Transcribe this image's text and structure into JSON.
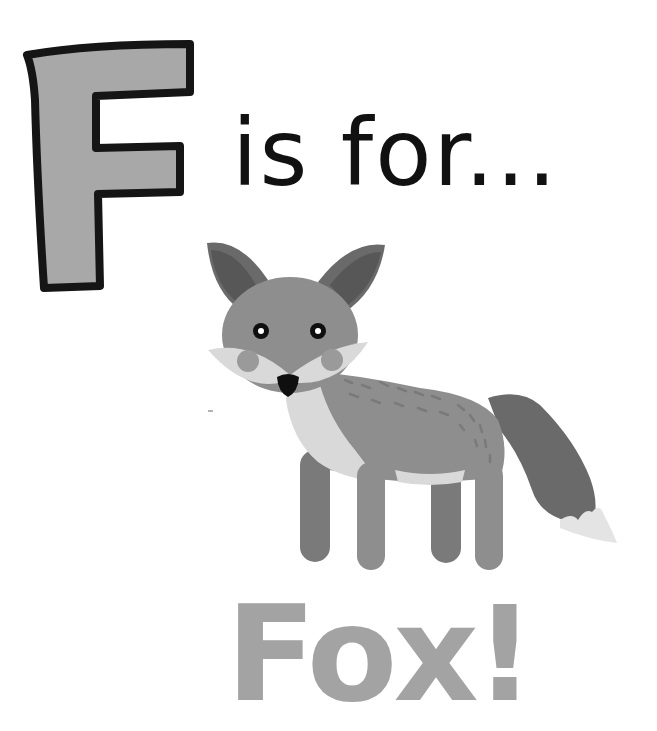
{
  "page": {
    "letter": "F",
    "phrase": "is for...",
    "word": "Fox!",
    "illustration": "fox",
    "colors": {
      "background": "#ffffff",
      "letter_fill": "#a8a8a8",
      "letter_outline": "#151515",
      "phrase_text": "#111111",
      "word_text": "#a3a3a3",
      "fox_body": "#8e8e8e",
      "fox_dark": "#6a6a6a",
      "fox_ear_inner": "#575757",
      "fox_light": "#d9d9d9",
      "fox_cheek": "#9a9a9a",
      "fox_nose": "#0f0f0f",
      "fox_tail_tip": "#e4e4e4"
    }
  }
}
